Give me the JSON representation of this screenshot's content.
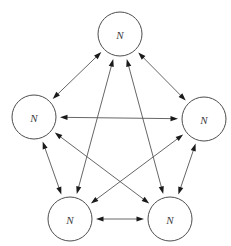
{
  "diagram": {
    "type": "directed-graph",
    "canvas": {
      "width": 231,
      "height": 246,
      "background": "#ffffff"
    },
    "style": {
      "node_fill": "#ffffff",
      "node_stroke": "#4d4d4d",
      "node_radius": 22,
      "edge_color": "#555555",
      "arrow_color": "#1a1a1a",
      "label_color": "#404040"
    },
    "nodes": [
      {
        "id": "top",
        "label": "N",
        "cx": 120,
        "cy": 34,
        "r": 22
      },
      {
        "id": "left",
        "label": "N",
        "cx": 34,
        "cy": 117,
        "r": 22
      },
      {
        "id": "right",
        "label": "N",
        "cx": 204,
        "cy": 119,
        "r": 22
      },
      {
        "id": "bottom-left",
        "label": "N",
        "cx": 70,
        "cy": 219,
        "r": 22
      },
      {
        "id": "bottom-right",
        "label": "N",
        "cx": 170,
        "cy": 219,
        "r": 22
      }
    ],
    "edges": [
      {
        "from": "top",
        "to": "left",
        "bidirectional": true
      },
      {
        "from": "top",
        "to": "right",
        "bidirectional": true
      },
      {
        "from": "top",
        "to": "bottom-left",
        "bidirectional": true
      },
      {
        "from": "top",
        "to": "bottom-right",
        "bidirectional": true
      },
      {
        "from": "left",
        "to": "right",
        "bidirectional": true
      },
      {
        "from": "left",
        "to": "bottom-left",
        "bidirectional": true
      },
      {
        "from": "left",
        "to": "bottom-right",
        "bidirectional": true
      },
      {
        "from": "right",
        "to": "bottom-left",
        "bidirectional": true
      },
      {
        "from": "right",
        "to": "bottom-right",
        "bidirectional": true
      },
      {
        "from": "bottom-left",
        "to": "bottom-right",
        "bidirectional": true
      }
    ]
  }
}
